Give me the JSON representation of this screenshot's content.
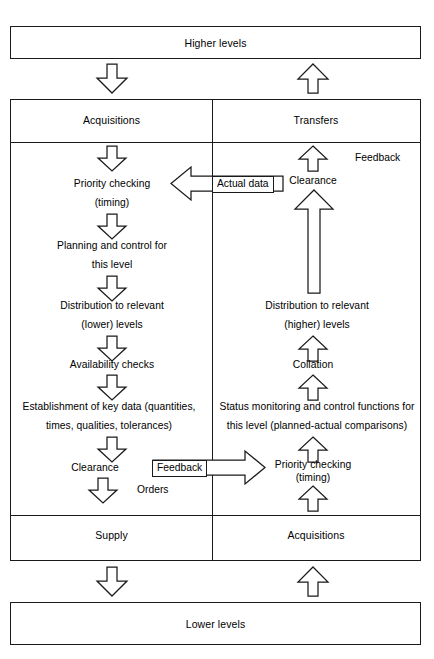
{
  "diagram": {
    "title_top": "Higher levels",
    "title_bottom": "Lower levels",
    "columns": {
      "left_header": "Acquisitions",
      "right_header": "Transfers",
      "left_footer": "Supply",
      "right_footer": "Acquisitions"
    },
    "left_column_steps": [
      {
        "line1": "Priority checking",
        "line2": "(timing)"
      },
      {
        "line1": "Planning and control for",
        "line2": "this level"
      },
      {
        "line1": "Distribution to relevant",
        "line2": "(lower) levels"
      },
      {
        "line1": "Availability checks",
        "line2": ""
      },
      {
        "line1": "Establishment of key data (quantities,",
        "line2": "times, qualities, tolerances)"
      },
      {
        "line1": "Clearance",
        "line2": ""
      }
    ],
    "right_column_steps": [
      {
        "line1": "Clearance",
        "line2": ""
      },
      {
        "line1": "Distribution to relevant",
        "line2": "(higher) levels"
      },
      {
        "line1": "Collation",
        "line2": ""
      },
      {
        "line1": "Status monitoring and control functions for",
        "line2": "this level (planned-actual comparisons)"
      },
      {
        "line1": "Priority checking",
        "line2": "(timing)"
      }
    ],
    "annotations": {
      "feedback_top": "Feedback",
      "actual_data": "Actual data",
      "feedback_bottom": "Feedback",
      "orders": "Orders"
    },
    "colors": {
      "stroke": "#1a1a1a",
      "fill": "#ffffff",
      "text": "#000000"
    }
  }
}
